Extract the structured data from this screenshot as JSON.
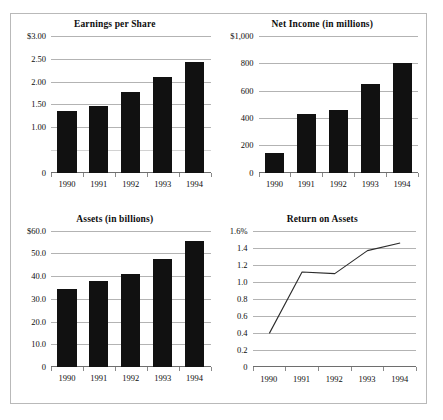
{
  "chart_data": [
    {
      "type": "bar",
      "title": "Earnings per Share",
      "xlabel": "",
      "ylabel": "",
      "categories": [
        "1990",
        "1991",
        "1992",
        "1993",
        "1994"
      ],
      "values": [
        1.35,
        1.47,
        1.78,
        2.1,
        2.43
      ],
      "ylim": [
        0,
        3.0
      ],
      "yticks": [
        3.0,
        2.5,
        2.0,
        1.5,
        1.0,
        0.5,
        0
      ],
      "yticklabels": [
        "$3.00",
        "2.50",
        "2.00",
        "1.50",
        "1.00",
        "",
        "0"
      ],
      "grid": true,
      "legend": "none",
      "bar_color": "#111111"
    },
    {
      "type": "bar",
      "title": "Net Income (in millions)",
      "xlabel": "",
      "ylabel": "",
      "categories": [
        "1990",
        "1991",
        "1992",
        "1993",
        "1994"
      ],
      "values": [
        140,
        430,
        455,
        650,
        805
      ],
      "ylim": [
        0,
        1000
      ],
      "yticks": [
        1000,
        800,
        600,
        400,
        200,
        0
      ],
      "yticklabels": [
        "$1,000",
        "800",
        "600",
        "400",
        "200",
        "0"
      ],
      "grid": true,
      "legend": "none",
      "bar_color": "#111111"
    },
    {
      "type": "bar",
      "title": "Assets (in billions)",
      "xlabel": "",
      "ylabel": "",
      "categories": [
        "1990",
        "1991",
        "1992",
        "1993",
        "1994"
      ],
      "values": [
        34.2,
        37.8,
        41.0,
        47.6,
        55.2
      ],
      "ylim": [
        0,
        60.0
      ],
      "yticks": [
        60.0,
        50.0,
        40.0,
        30.0,
        20.0,
        10.0,
        0
      ],
      "yticklabels": [
        "$60.0",
        "50.0",
        "40.0",
        "30.0",
        "20.0",
        "10.0",
        "0"
      ],
      "grid": true,
      "legend": "none",
      "bar_color": "#111111"
    },
    {
      "type": "line",
      "title": "Return on Assets",
      "xlabel": "",
      "ylabel": "",
      "categories": [
        "1990",
        "1991",
        "1992",
        "1993",
        "1994"
      ],
      "values": [
        0.4,
        1.12,
        1.1,
        1.37,
        1.46
      ],
      "ylim": [
        0,
        1.6
      ],
      "yticks": [
        1.6,
        1.4,
        1.2,
        1.0,
        0.8,
        0.6,
        0.4,
        0.2,
        0
      ],
      "yticklabels": [
        "1.6%",
        "1.4",
        "1.2",
        "1.0",
        "0.8",
        "0.6",
        "0.4",
        "0.2",
        "0"
      ],
      "grid": true,
      "legend": "none",
      "line_color": "#2b2b2b"
    }
  ]
}
